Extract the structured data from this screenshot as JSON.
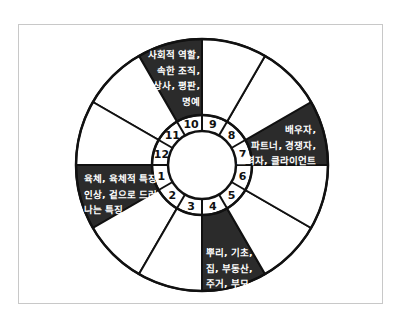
{
  "diagram": {
    "type": "astrology-house-wheel",
    "colors": {
      "dark_fill": "#2b2b2b",
      "light_fill": "#ffffff",
      "stroke": "#111111",
      "dark_text": "#ffffff",
      "frame": "#c8c8c8"
    },
    "houses": [
      {
        "number": "1",
        "dark": true,
        "lines": [
          "육체, 육체적 특징,",
          "인상, 겉으로 드러",
          "나는 특징"
        ]
      },
      {
        "number": "2",
        "dark": false,
        "lines": []
      },
      {
        "number": "3",
        "dark": false,
        "lines": []
      },
      {
        "number": "4",
        "dark": true,
        "lines": [
          "뿌리, 기초,",
          "집, 부동산,",
          "주거, 부모"
        ]
      },
      {
        "number": "5",
        "dark": false,
        "lines": []
      },
      {
        "number": "6",
        "dark": false,
        "lines": []
      },
      {
        "number": "7",
        "dark": true,
        "lines": [
          "배우자,",
          "파트너, 경쟁자,",
          "조력자, 클라이언트"
        ]
      },
      {
        "number": "8",
        "dark": false,
        "lines": []
      },
      {
        "number": "9",
        "dark": false,
        "lines": []
      },
      {
        "number": "10",
        "dark": true,
        "lines": [
          "사회적 역할,",
          "속한 조직,",
          "상사, 평판,",
          "명예"
        ]
      },
      {
        "number": "11",
        "dark": false,
        "lines": []
      },
      {
        "number": "12",
        "dark": false,
        "lines": []
      }
    ]
  }
}
